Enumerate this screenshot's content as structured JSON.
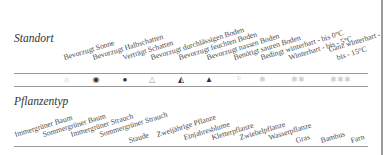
{
  "standort": {
    "title": "Standort",
    "labels": [
      "Bevorzugt Sonne",
      "Bevorzugt Halbschatten",
      "Verträgt Schatten",
      "Bevorzugt durchlässigen Boden",
      "Bevorzugt feuchten Boden",
      "Bevorzugt nassen Boden",
      "Benötigt sauren Boden",
      "Bedingt winterhart - bis 0°C",
      "Winterhart - bis - 5°C",
      "Ganz winterhart -",
      "bis - 15°C"
    ],
    "icons": [
      {
        "name": "sun-icon",
        "glyph": "☼"
      },
      {
        "name": "half-shade-icon",
        "glyph": "◉"
      },
      {
        "name": "shade-icon",
        "glyph": "●"
      },
      {
        "name": "drop-outline-icon",
        "glyph": "△"
      },
      {
        "name": "drop-half-icon",
        "glyph": "◭"
      },
      {
        "name": "drop-filled-icon",
        "glyph": "▲"
      },
      {
        "name": "acid-soil-icon",
        "glyph": "ᵁ"
      },
      {
        "name": "snowflake-1-icon",
        "glyph": "❄"
      },
      {
        "name": "snowflake-2-icon",
        "glyph": "❄❄"
      },
      {
        "name": "snowflake-3-icon",
        "glyph": "❄❄❄"
      }
    ]
  },
  "pflanzentyp": {
    "title": "Pflanzentyp",
    "labels": [
      "Immergrüner Baum",
      "Sommergrüner Baum",
      "Immergrüner Strauch",
      "Sommergrüner Strauch",
      "Staude",
      "Zweijährige Pflanze",
      "Einjahresblume",
      "Kletterpflanze",
      "Zwiebelpflanze",
      "Wasserpflanze",
      "Gras",
      "Bambus",
      "Farn"
    ]
  }
}
